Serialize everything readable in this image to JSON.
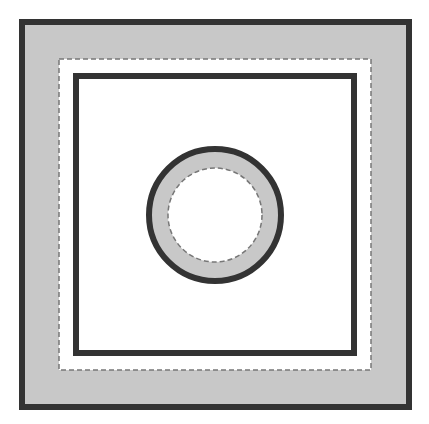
{
  "diagram": {
    "background": "#ffffff",
    "fill_color": "#c8c8c8",
    "stroke_color": "#333333",
    "dash_color": "#777777",
    "outer_square": {
      "x": 22,
      "y": 22,
      "size": 387,
      "stroke_width": 6
    },
    "dashed_square": {
      "x": 59,
      "y": 59,
      "size": 312,
      "stroke_width": 1.5
    },
    "inner_square": {
      "x": 76,
      "y": 76,
      "size": 278,
      "stroke_width": 6
    },
    "outer_circle": {
      "cx": 215,
      "cy": 215,
      "r": 66,
      "stroke_width": 6
    },
    "dashed_circle": {
      "cx": 215,
      "cy": 215,
      "r": 47,
      "stroke_width": 1.5
    }
  }
}
